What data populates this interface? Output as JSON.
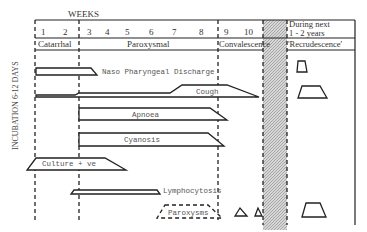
{
  "header": {
    "weeks_label": "WEEKS",
    "week_numbers": [
      "1",
      "2",
      "3",
      "4",
      "5",
      "6",
      "7",
      "8",
      "9",
      "10"
    ],
    "later_label_line1": "During next",
    "later_label_line2": "1 - 2 years"
  },
  "phases": {
    "catarrhal": "Catarrhal",
    "paroxysmal": "Paroxysmal",
    "convalescence": "Convalescence",
    "recrudescence": "'Recrudescence'"
  },
  "side_label": "INCUBATION 6-12 DAYS",
  "bars": {
    "naso": "Naso Pharyngeal Discharge",
    "cough": "Cough",
    "apnoea": "Apnoea",
    "cyanosis": "Cyanosis",
    "culture": "Culture + ve",
    "lymphocytosis": "Lymphocytosis",
    "paroxysms": "Paroxysms"
  },
  "colors": {
    "line": "#222222",
    "text": "#444444",
    "hatch": "#bdbdbd"
  }
}
